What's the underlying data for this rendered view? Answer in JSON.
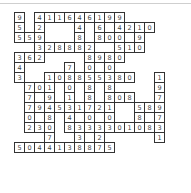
{
  "puzzle": {
    "type": "number-fill-in",
    "cols": 15,
    "rows": 15,
    "cell_size": 11,
    "cells": [
      {
        "r": 0,
        "c": 0,
        "v": "9"
      },
      {
        "r": 0,
        "c": 2,
        "v": "4"
      },
      {
        "r": 0,
        "c": 3,
        "v": "1"
      },
      {
        "r": 0,
        "c": 4,
        "v": "1"
      },
      {
        "r": 0,
        "c": 5,
        "v": "6"
      },
      {
        "r": 0,
        "c": 6,
        "v": "4"
      },
      {
        "r": 0,
        "c": 7,
        "v": "6"
      },
      {
        "r": 0,
        "c": 8,
        "v": "1"
      },
      {
        "r": 0,
        "c": 9,
        "v": "9"
      },
      {
        "r": 0,
        "c": 10,
        "v": "9"
      },
      {
        "r": 1,
        "c": 0,
        "v": "5"
      },
      {
        "r": 1,
        "c": 2,
        "v": "2"
      },
      {
        "r": 1,
        "c": 6,
        "v": "4"
      },
      {
        "r": 1,
        "c": 8,
        "v": "6"
      },
      {
        "r": 1,
        "c": 9,
        "v": ""
      },
      {
        "r": 1,
        "c": 10,
        "v": "4"
      },
      {
        "r": 1,
        "c": 11,
        "v": "2"
      },
      {
        "r": 1,
        "c": 12,
        "v": "1"
      },
      {
        "r": 1,
        "c": 13,
        "v": "0"
      },
      {
        "r": 2,
        "c": 0,
        "v": "5"
      },
      {
        "r": 2,
        "c": 1,
        "v": "5"
      },
      {
        "r": 2,
        "c": 2,
        "v": "9"
      },
      {
        "r": 2,
        "c": 6,
        "v": "8"
      },
      {
        "r": 2,
        "c": 8,
        "v": "8"
      },
      {
        "r": 2,
        "c": 9,
        "v": "0"
      },
      {
        "r": 2,
        "c": 10,
        "v": "0"
      },
      {
        "r": 2,
        "c": 11,
        "v": ""
      },
      {
        "r": 2,
        "c": 12,
        "v": "9"
      },
      {
        "r": 3,
        "c": 2,
        "v": "3"
      },
      {
        "r": 3,
        "c": 3,
        "v": "2"
      },
      {
        "r": 3,
        "c": 4,
        "v": "8"
      },
      {
        "r": 3,
        "c": 5,
        "v": "8"
      },
      {
        "r": 3,
        "c": 6,
        "v": "8"
      },
      {
        "r": 3,
        "c": 7,
        "v": "2"
      },
      {
        "r": 3,
        "c": 10,
        "v": "5"
      },
      {
        "r": 3,
        "c": 11,
        "v": "1"
      },
      {
        "r": 3,
        "c": 12,
        "v": "0"
      },
      {
        "r": 4,
        "c": 0,
        "v": "3"
      },
      {
        "r": 4,
        "c": 1,
        "v": "6"
      },
      {
        "r": 4,
        "c": 2,
        "v": "2"
      },
      {
        "r": 4,
        "c": 7,
        "v": "8"
      },
      {
        "r": 4,
        "c": 8,
        "v": "9"
      },
      {
        "r": 4,
        "c": 9,
        "v": "8"
      },
      {
        "r": 4,
        "c": 10,
        "v": "0"
      },
      {
        "r": 5,
        "c": 0,
        "v": "4"
      },
      {
        "r": 5,
        "c": 5,
        "v": "7"
      },
      {
        "r": 5,
        "c": 7,
        "v": "0"
      },
      {
        "r": 5,
        "c": 8,
        "v": ""
      },
      {
        "r": 5,
        "c": 9,
        "v": "0"
      },
      {
        "r": 6,
        "c": 0,
        "v": "3"
      },
      {
        "r": 6,
        "c": 3,
        "v": "1"
      },
      {
        "r": 6,
        "c": 4,
        "v": "0"
      },
      {
        "r": 6,
        "c": 5,
        "v": "8"
      },
      {
        "r": 6,
        "c": 6,
        "v": "8"
      },
      {
        "r": 6,
        "c": 7,
        "v": "5"
      },
      {
        "r": 6,
        "c": 8,
        "v": "5"
      },
      {
        "r": 6,
        "c": 9,
        "v": "3"
      },
      {
        "r": 6,
        "c": 10,
        "v": "8"
      },
      {
        "r": 6,
        "c": 11,
        "v": "0"
      },
      {
        "r": 6,
        "c": 14,
        "v": "1"
      },
      {
        "r": 7,
        "c": 1,
        "v": "7"
      },
      {
        "r": 7,
        "c": 2,
        "v": "0"
      },
      {
        "r": 7,
        "c": 3,
        "v": "1"
      },
      {
        "r": 7,
        "c": 5,
        "v": "0"
      },
      {
        "r": 7,
        "c": 7,
        "v": "8"
      },
      {
        "r": 7,
        "c": 9,
        "v": "8"
      },
      {
        "r": 7,
        "c": 14,
        "v": "9"
      },
      {
        "r": 8,
        "c": 1,
        "v": "7"
      },
      {
        "r": 8,
        "c": 2,
        "v": ""
      },
      {
        "r": 8,
        "c": 3,
        "v": "9"
      },
      {
        "r": 8,
        "c": 5,
        "v": "1"
      },
      {
        "r": 8,
        "c": 7,
        "v": "8"
      },
      {
        "r": 8,
        "c": 9,
        "v": "8"
      },
      {
        "r": 8,
        "c": 10,
        "v": "0"
      },
      {
        "r": 8,
        "c": 11,
        "v": "8"
      },
      {
        "r": 8,
        "c": 14,
        "v": "7"
      },
      {
        "r": 9,
        "c": 1,
        "v": "7"
      },
      {
        "r": 9,
        "c": 2,
        "v": "9"
      },
      {
        "r": 9,
        "c": 3,
        "v": "4"
      },
      {
        "r": 9,
        "c": 4,
        "v": "5"
      },
      {
        "r": 9,
        "c": 5,
        "v": "3"
      },
      {
        "r": 9,
        "c": 6,
        "v": "1"
      },
      {
        "r": 9,
        "c": 7,
        "v": "7"
      },
      {
        "r": 9,
        "c": 8,
        "v": "2"
      },
      {
        "r": 9,
        "c": 9,
        "v": "1"
      },
      {
        "r": 9,
        "c": 12,
        "v": "5"
      },
      {
        "r": 9,
        "c": 13,
        "v": "8"
      },
      {
        "r": 9,
        "c": 14,
        "v": "9"
      },
      {
        "r": 10,
        "c": 1,
        "v": "0"
      },
      {
        "r": 10,
        "c": 2,
        "v": ""
      },
      {
        "r": 10,
        "c": 3,
        "v": "8"
      },
      {
        "r": 10,
        "c": 5,
        "v": "4"
      },
      {
        "r": 10,
        "c": 6,
        "v": ""
      },
      {
        "r": 10,
        "c": 7,
        "v": "0"
      },
      {
        "r": 10,
        "c": 8,
        "v": ""
      },
      {
        "r": 10,
        "c": 9,
        "v": "0"
      },
      {
        "r": 10,
        "c": 12,
        "v": "8"
      },
      {
        "r": 10,
        "c": 13,
        "v": ""
      },
      {
        "r": 10,
        "c": 14,
        "v": "7"
      },
      {
        "r": 11,
        "c": 1,
        "v": "2"
      },
      {
        "r": 11,
        "c": 2,
        "v": "3"
      },
      {
        "r": 11,
        "c": 3,
        "v": "0"
      },
      {
        "r": 11,
        "c": 5,
        "v": "8"
      },
      {
        "r": 11,
        "c": 6,
        "v": "3"
      },
      {
        "r": 11,
        "c": 7,
        "v": "3"
      },
      {
        "r": 11,
        "c": 8,
        "v": "3"
      },
      {
        "r": 11,
        "c": 9,
        "v": "3"
      },
      {
        "r": 11,
        "c": 10,
        "v": "0"
      },
      {
        "r": 11,
        "c": 11,
        "v": "1"
      },
      {
        "r": 11,
        "c": 12,
        "v": "0"
      },
      {
        "r": 11,
        "c": 13,
        "v": "8"
      },
      {
        "r": 11,
        "c": 14,
        "v": "3"
      },
      {
        "r": 12,
        "c": 3,
        "v": "7"
      },
      {
        "r": 12,
        "c": 6,
        "v": "3"
      },
      {
        "r": 12,
        "c": 7,
        "v": ""
      },
      {
        "r": 12,
        "c": 8,
        "v": "2"
      },
      {
        "r": 12,
        "c": 14,
        "v": "1"
      },
      {
        "r": 13,
        "c": 0,
        "v": "5"
      },
      {
        "r": 13,
        "c": 1,
        "v": "0"
      },
      {
        "r": 13,
        "c": 2,
        "v": "4"
      },
      {
        "r": 13,
        "c": 3,
        "v": "4"
      },
      {
        "r": 13,
        "c": 4,
        "v": "1"
      },
      {
        "r": 13,
        "c": 5,
        "v": "3"
      },
      {
        "r": 13,
        "c": 6,
        "v": "8"
      },
      {
        "r": 13,
        "c": 7,
        "v": "8"
      },
      {
        "r": 13,
        "c": 8,
        "v": "7"
      },
      {
        "r": 13,
        "c": 9,
        "v": "5"
      }
    ]
  }
}
